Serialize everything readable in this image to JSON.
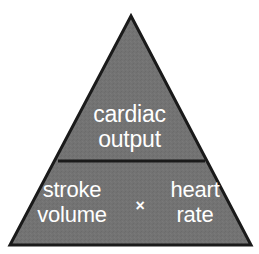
{
  "diagram": {
    "type": "pyramid",
    "background_color": "#ffffff",
    "shape": {
      "fill_color": "#737373",
      "stroke_color": "#1a1a1a",
      "stroke_width": 3,
      "apex": {
        "x": 131,
        "y": 16
      },
      "base_left": {
        "x": 10,
        "y": 245
      },
      "base_right": {
        "x": 251,
        "y": 245
      },
      "divider": {
        "y": 161,
        "x_start": 58,
        "x_end": 205
      }
    },
    "text_color": "#ffffff",
    "tiers": [
      {
        "id": "top",
        "name": "cardiac-output",
        "lines": [
          "cardiac",
          "output"
        ]
      },
      {
        "id": "bottom",
        "name": "stroke-volume-times-heart-rate",
        "left": {
          "lines": [
            "stroke",
            "volume"
          ]
        },
        "operator": "×",
        "right": {
          "lines": [
            "heart",
            "rate"
          ]
        }
      }
    ]
  }
}
